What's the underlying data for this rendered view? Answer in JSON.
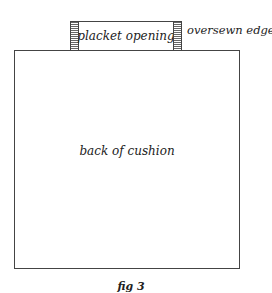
{
  "figure": {
    "placket_label": "placket opening",
    "oversewn_label": "oversewn edges",
    "cushion_label": "back of cushion",
    "caption": "fig 3"
  }
}
